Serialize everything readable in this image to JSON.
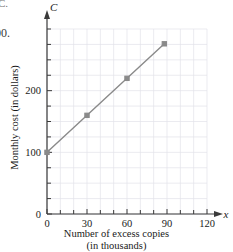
{
  "page": {
    "artifact_top": "C.",
    "artifact_number": "00."
  },
  "chart_data": {
    "type": "line",
    "title": "",
    "subtitle": "",
    "xlabel": "Number of excess copies",
    "xlabel_line2": "(in thousands)",
    "ylabel": "Monthly cost (in dollars)",
    "x_axis_variable": "x",
    "y_axis_variable": "C",
    "xlim": [
      0,
      120
    ],
    "ylim": [
      0,
      300
    ],
    "x_major_ticks": [
      0,
      30,
      60,
      90,
      120
    ],
    "x_major_tick_labels": [
      "0",
      "30",
      "60",
      "90",
      "120"
    ],
    "x_minor_tick_step": 10,
    "y_major_ticks": [
      0,
      100,
      200
    ],
    "y_major_tick_labels": [
      "0",
      "100",
      "200"
    ],
    "y_minor_tick_step": 25,
    "grid": true,
    "grid_color": "#e3e3ea",
    "legend": false,
    "legend_position": "none",
    "line_color": "#8a8a8a",
    "marker_color": "#8a8a8a",
    "marker_shape": "square",
    "equation": "C = 100 + 2x",
    "series": [
      {
        "name": "Monthly cost",
        "x": [
          0,
          30,
          60,
          88
        ],
        "y": [
          100,
          160,
          220,
          276
        ],
        "points": [
          {
            "x": 0,
            "y": 100
          },
          {
            "x": 30,
            "y": 160
          },
          {
            "x": 60,
            "y": 220
          },
          {
            "x": 88,
            "y": 276
          }
        ]
      }
    ]
  }
}
